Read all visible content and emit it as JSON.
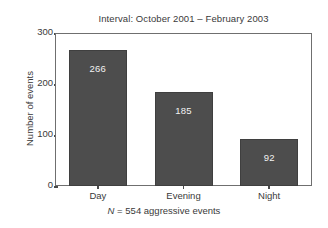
{
  "chart_data": {
    "type": "bar",
    "title": "Interval: October 2001 – February 2003",
    "categories": [
      "Day",
      "Evening",
      "Night"
    ],
    "values": [
      266,
      185,
      92
    ],
    "xlabel": "",
    "ylabel": "Number of events",
    "ylim": [
      0,
      300
    ],
    "yticks": [
      0,
      100,
      200,
      300
    ],
    "ytick_labels": [
      "0",
      "100",
      "200",
      "300"
    ],
    "grid": false,
    "legend": false,
    "bar_color": "#4d4d4d",
    "value_label_color": "#f2f2f2",
    "annotations": [
      {
        "text": "N = 554 aggressive events",
        "position": "below-axis"
      }
    ]
  },
  "caption": {
    "n_symbol": "N",
    "rest": " = 554 aggressive events"
  }
}
